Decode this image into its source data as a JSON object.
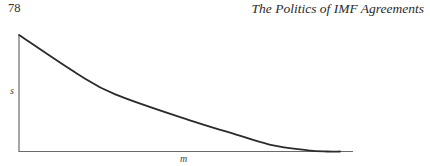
{
  "header": {
    "page_number": "78",
    "running_title": "The Politics of IMF Agreements"
  },
  "figure": {
    "ink_color": "#2b2b2b",
    "axis_color": "#6a6a6a"
  },
  "chart_data": {
    "type": "line",
    "title": "",
    "xlabel": "m",
    "ylabel": "s",
    "xlim": [
      0,
      1
    ],
    "ylim": [
      0,
      1
    ],
    "grid": false,
    "legend": "none",
    "x_ticks": [],
    "y_ticks": [],
    "series": [
      {
        "name": "s(m)",
        "description": "decreasing convex curve that reaches the m-axis tangentially near the right end",
        "x": [
          0.0,
          0.18,
          0.3,
          0.54,
          0.66,
          0.78,
          0.9,
          0.96,
          1.0
        ],
        "y": [
          1.0,
          0.67,
          0.49,
          0.26,
          0.16,
          0.06,
          0.01,
          0.0,
          0.0
        ]
      }
    ]
  }
}
